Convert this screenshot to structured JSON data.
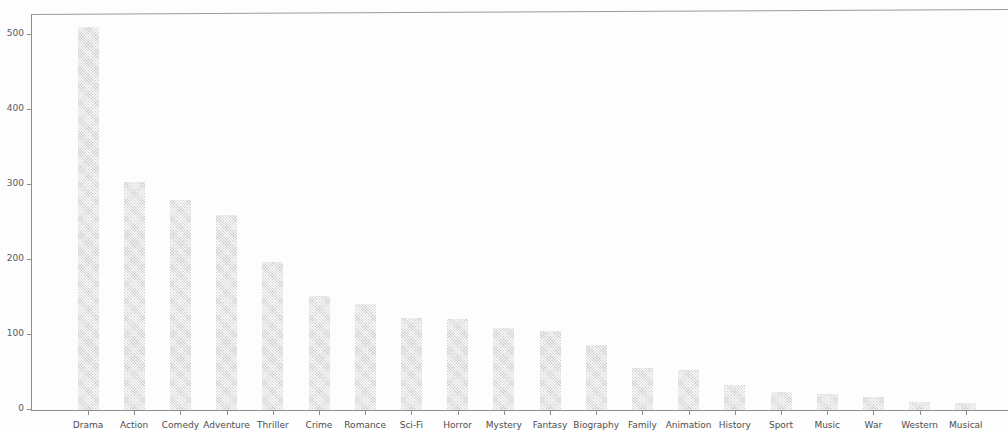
{
  "chart_data": {
    "type": "bar",
    "title": "",
    "subtitle": "",
    "xlabel": "",
    "ylabel": "",
    "grid": false,
    "legend": null,
    "ylim": [
      0,
      530
    ],
    "yticks": [
      0,
      100,
      200,
      300,
      400,
      500
    ],
    "ytick_labels": [
      "0",
      "100",
      "200",
      "300",
      "400",
      "500"
    ],
    "categories": [
      "Drama",
      "Action",
      "Comedy",
      "Adventure",
      "Thriller",
      "Crime",
      "Romance",
      "Sci-Fi",
      "Horror",
      "Mystery",
      "Fantasy",
      "Biography",
      "Family",
      "Animation",
      "History",
      "Sport",
      "Music",
      "War",
      "Western",
      "Musical"
    ],
    "values": [
      511,
      304,
      281,
      260,
      197,
      152,
      142,
      123,
      122,
      109,
      105,
      87,
      56,
      53,
      34,
      24,
      22,
      17,
      11,
      9
    ],
    "series": [
      {
        "name": "Count",
        "values": [
          511,
          304,
          281,
          260,
          197,
          152,
          142,
          123,
          122,
          109,
          105,
          87,
          56,
          53,
          34,
          24,
          22,
          17,
          11,
          9
        ]
      }
    ],
    "bar_color": "#d2d2d2",
    "axis_color": "#8d8d8d",
    "background_color": "#fdfdfd"
  }
}
